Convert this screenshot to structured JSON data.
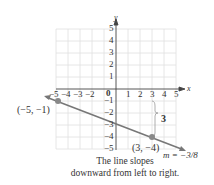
{
  "axes": {
    "x_label": "x",
    "y_label": "y",
    "x_ticks": [
      "−5",
      "−4",
      "−3",
      "−2",
      "1",
      "2",
      "3",
      "4",
      "5"
    ],
    "y_ticks": [
      "5",
      "4",
      "3",
      "2",
      "1",
      "−1",
      "−2",
      "−3",
      "−4",
      "−5"
    ],
    "origin_label": "0"
  },
  "points": [
    {
      "label": "(−5, −1)",
      "x": -5,
      "y": -1
    },
    {
      "label": "(3, −4)",
      "x": 3,
      "y": -4
    }
  ],
  "rise_label": "3",
  "slope_label": "m = −3/8",
  "caption": [
    "The line slopes",
    "downward from left to right."
  ],
  "colors": {
    "line": "#777777",
    "point": "#888888",
    "grid": "#e2e2e2"
  }
}
